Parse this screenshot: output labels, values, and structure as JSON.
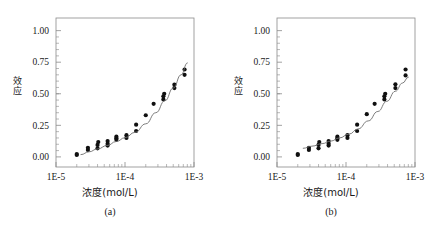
{
  "figure": {
    "panels": [
      {
        "caption": "(a)",
        "ylabel": "效应",
        "xlabel": "浓度(mol/L)",
        "yticks": [
          "0.00",
          "0.25",
          "0.50",
          "0.75",
          "1.00"
        ],
        "xticks": [
          "1E-5",
          "1E-4",
          "1E-3"
        ]
      },
      {
        "caption": "(b)",
        "ylabel": "效应",
        "xlabel": "浓度(mol/L)",
        "yticks": [
          "0.00",
          "0.25",
          "0.50",
          "0.75",
          "1.00"
        ],
        "xticks": [
          "1E-5",
          "1E-4",
          "1E-3"
        ]
      }
    ]
  },
  "colors": {
    "axis": "#8a8a8a",
    "marker": "#101010",
    "curve": "#6e6e6e",
    "text": "#1a1a1a",
    "background": "#ffffff"
  },
  "chart_data": [
    {
      "type": "scatter",
      "title": "(a)",
      "xlabel": "浓度(mol/L)",
      "ylabel": "效应",
      "xscale": "log",
      "xlim": [
        1e-05,
        0.001
      ],
      "ylim": [
        -0.08,
        1.1
      ],
      "yticks": [
        0.0,
        0.25,
        0.5,
        0.75,
        1.0
      ],
      "xticks": [
        1e-05,
        0.0001,
        0.001
      ],
      "grid": false,
      "legend": null,
      "series": [
        {
          "name": "观测值",
          "kind": "scatter",
          "points": [
            [
              2e-05,
              0.015
            ],
            [
              2e-05,
              0.022
            ],
            [
              2.9e-05,
              0.055
            ],
            [
              2.9e-05,
              0.072
            ],
            [
              4e-05,
              0.068
            ],
            [
              4e-05,
              0.095
            ],
            [
              4.1e-05,
              0.118
            ],
            [
              5.6e-05,
              0.09
            ],
            [
              5.6e-05,
              0.105
            ],
            [
              5.6e-05,
              0.125
            ],
            [
              7.5e-05,
              0.135
            ],
            [
              7.5e-05,
              0.148
            ],
            [
              7.5e-05,
              0.16
            ],
            [
              0.000105,
              0.15
            ],
            [
              0.000105,
              0.172
            ],
            [
              0.000145,
              0.205
            ],
            [
              0.000145,
              0.255
            ],
            [
              0.0002,
              0.33
            ],
            [
              0.00026,
              0.42
            ],
            [
              0.00036,
              0.455
            ],
            [
              0.00036,
              0.48
            ],
            [
              0.00037,
              0.5
            ],
            [
              0.00052,
              0.545
            ],
            [
              0.00052,
              0.572
            ],
            [
              0.00073,
              0.65
            ],
            [
              0.00073,
              0.692
            ]
          ]
        },
        {
          "name": "拟合曲线",
          "kind": "line",
          "points": [
            [
              2.3e-05,
              0.018
            ],
            [
              3e-05,
              0.04
            ],
            [
              4e-05,
              0.063
            ],
            [
              5.5e-05,
              0.09
            ],
            [
              7.5e-05,
              0.122
            ],
            [
              0.0001,
              0.152
            ],
            [
              0.00014,
              0.195
            ],
            [
              0.0002,
              0.262
            ],
            [
              0.00028,
              0.35
            ],
            [
              0.00038,
              0.445
            ],
            [
              0.0005,
              0.545
            ],
            [
              0.00065,
              0.65
            ],
            [
              0.0008,
              0.745
            ]
          ]
        }
      ]
    },
    {
      "type": "scatter",
      "title": "(b)",
      "xlabel": "浓度(mol/L)",
      "ylabel": "效应",
      "xscale": "log",
      "xlim": [
        1e-05,
        0.001
      ],
      "ylim": [
        -0.08,
        1.1
      ],
      "yticks": [
        0.0,
        0.25,
        0.5,
        0.75,
        1.0
      ],
      "xticks": [
        1e-05,
        0.0001,
        0.001
      ],
      "grid": false,
      "legend": null,
      "series": [
        {
          "name": "观测值",
          "kind": "scatter",
          "points": [
            [
              2e-05,
              0.015
            ],
            [
              2e-05,
              0.022
            ],
            [
              2.9e-05,
              0.055
            ],
            [
              2.9e-05,
              0.072
            ],
            [
              4e-05,
              0.068
            ],
            [
              4e-05,
              0.095
            ],
            [
              4.1e-05,
              0.118
            ],
            [
              5.6e-05,
              0.09
            ],
            [
              5.6e-05,
              0.105
            ],
            [
              5.6e-05,
              0.125
            ],
            [
              7.5e-05,
              0.135
            ],
            [
              7.5e-05,
              0.148
            ],
            [
              7.5e-05,
              0.16
            ],
            [
              0.000105,
              0.15
            ],
            [
              0.000105,
              0.172
            ],
            [
              0.000145,
              0.205
            ],
            [
              0.000145,
              0.255
            ],
            [
              0.0002,
              0.338
            ],
            [
              0.00026,
              0.42
            ],
            [
              0.00036,
              0.455
            ],
            [
              0.00036,
              0.48
            ],
            [
              0.00037,
              0.5
            ],
            [
              0.00052,
              0.545
            ],
            [
              0.00052,
              0.575
            ],
            [
              0.00073,
              0.645
            ],
            [
              0.00073,
              0.692
            ]
          ]
        },
        {
          "name": "拟合曲线",
          "kind": "line",
          "points": [
            [
              2.4e-05,
              0.068
            ],
            [
              3.2e-05,
              0.085
            ],
            [
              4.5e-05,
              0.105
            ],
            [
              6e-05,
              0.125
            ],
            [
              8e-05,
              0.15
            ],
            [
              0.00011,
              0.18
            ],
            [
              0.00015,
              0.222
            ],
            [
              0.00021,
              0.285
            ],
            [
              0.00029,
              0.36
            ],
            [
              0.00039,
              0.44
            ],
            [
              0.00052,
              0.52
            ],
            [
              0.00066,
              0.585
            ],
            [
              0.0008,
              0.632
            ]
          ]
        }
      ]
    }
  ]
}
